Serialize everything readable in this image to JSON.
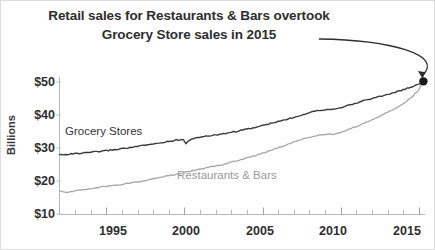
{
  "chart_data": {
    "type": "line",
    "title": "Retail sales for Restaurants & Bars overtook Grocery Store sales in 2015",
    "title_lines": [
      "Retail sales for Restaurants & Bars overtook",
      "Grocery Store sales in 2015"
    ],
    "xlabel": "",
    "ylabel": "Billions",
    "xlim": [
      1992.0,
      2015.4
    ],
    "ylim": [
      10,
      52
    ],
    "grid": false,
    "legend_position": "inline-labels",
    "y_ticks": [
      10,
      20,
      30,
      40,
      50
    ],
    "y_tick_labels": [
      "$10",
      "$20",
      "$30",
      "$40",
      "$50"
    ],
    "x_ticks": [
      1995,
      2000,
      2005,
      2010,
      2015
    ],
    "x_tick_labels": [
      "1995",
      "2000",
      "2005",
      "2010",
      "2015"
    ],
    "x_minor_tick_interval": 1,
    "annotations": [
      {
        "name": "crossover-marker",
        "type": "point-marker",
        "x": 2015.3,
        "y": 50.2,
        "color": "#1a1a1a"
      },
      {
        "name": "title-arrow",
        "type": "curved-arrow",
        "from": [
          2009.2,
          57.5
        ],
        "to": [
          2015.2,
          50.8
        ]
      }
    ],
    "series": [
      {
        "name": "Grocery Stores",
        "label": "Grocery Stores",
        "color": "#3b3b3b",
        "x": [
          1992.0,
          1992.5,
          1993.0,
          1993.5,
          1994.0,
          1994.5,
          1995.0,
          1995.5,
          1996.0,
          1996.5,
          1997.0,
          1997.5,
          1998.0,
          1998.5,
          1999.0,
          1999.5,
          1999.9,
          2000.1,
          2000.5,
          2001.0,
          2001.5,
          2002.0,
          2002.5,
          2003.0,
          2003.5,
          2004.0,
          2004.5,
          2005.0,
          2005.5,
          2006.0,
          2006.5,
          2007.0,
          2007.5,
          2008.0,
          2008.5,
          2009.0,
          2009.5,
          2010.0,
          2010.5,
          2011.0,
          2011.5,
          2012.0,
          2012.5,
          2013.0,
          2013.5,
          2014.0,
          2014.5,
          2015.0,
          2015.3
        ],
        "y": [
          28.0,
          28.1,
          28.3,
          28.4,
          28.7,
          28.9,
          29.2,
          29.5,
          29.8,
          30.1,
          30.5,
          30.8,
          31.2,
          31.6,
          32.0,
          32.4,
          32.7,
          31.4,
          32.9,
          33.3,
          33.6,
          34.0,
          34.3,
          34.8,
          35.2,
          35.7,
          36.2,
          36.8,
          37.4,
          38.0,
          38.6,
          39.3,
          40.0,
          40.8,
          41.4,
          41.6,
          41.8,
          42.3,
          42.9,
          43.6,
          44.4,
          45.0,
          45.6,
          46.2,
          46.9,
          47.6,
          48.4,
          49.4,
          50.2
        ]
      },
      {
        "name": "Restaurants & Bars",
        "label": "Restaurants & Bars",
        "color": "#a6a6a6",
        "x": [
          1992.0,
          1992.5,
          1993.0,
          1993.5,
          1994.0,
          1994.5,
          1995.0,
          1995.5,
          1996.0,
          1996.5,
          1997.0,
          1997.5,
          1998.0,
          1998.5,
          1999.0,
          1999.5,
          2000.0,
          2000.5,
          2001.0,
          2001.5,
          2002.0,
          2002.5,
          2003.0,
          2003.5,
          2004.0,
          2004.5,
          2005.0,
          2005.5,
          2006.0,
          2006.5,
          2007.0,
          2007.5,
          2008.0,
          2008.5,
          2009.0,
          2009.5,
          2010.0,
          2010.5,
          2011.0,
          2011.5,
          2012.0,
          2012.5,
          2013.0,
          2013.5,
          2014.0,
          2014.5,
          2015.0,
          2015.3
        ],
        "y": [
          17.0,
          16.6,
          17.1,
          17.4,
          17.7,
          18.0,
          18.4,
          18.7,
          19.0,
          19.4,
          19.8,
          20.2,
          20.7,
          21.1,
          21.6,
          22.1,
          22.6,
          23.1,
          23.6,
          24.1,
          24.6,
          25.1,
          25.7,
          26.3,
          27.0,
          27.7,
          28.5,
          29.3,
          30.1,
          30.9,
          31.8,
          32.6,
          33.3,
          33.8,
          34.0,
          34.2,
          34.8,
          35.6,
          36.5,
          37.5,
          38.6,
          39.7,
          40.8,
          42.0,
          43.4,
          45.2,
          47.6,
          50.2
        ]
      }
    ]
  }
}
